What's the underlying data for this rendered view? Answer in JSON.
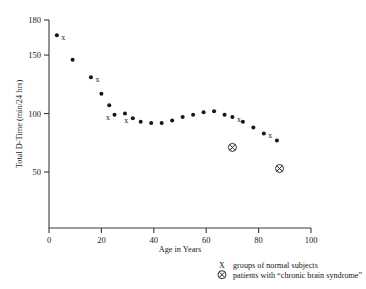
{
  "chart_data": {
    "type": "scatter",
    "title": "",
    "xlabel": "Age in Years",
    "ylabel": "Total D-Time (min/24 hrs)",
    "xlim": [
      0,
      100
    ],
    "ylim": [
      0,
      180
    ],
    "xticks": [
      0,
      20,
      40,
      60,
      80,
      100
    ],
    "yticks": [
      50,
      100,
      150,
      180
    ],
    "grid": false,
    "legend_position": "below-right",
    "series": [
      {
        "name": "groups of normal subjects",
        "marker": "dot-with-x",
        "points": [
          {
            "x": 3,
            "y": 167,
            "marked": true
          },
          {
            "x": 9,
            "y": 146,
            "marked": false
          },
          {
            "x": 16,
            "y": 131,
            "marked": true
          },
          {
            "x": 20,
            "y": 117,
            "marked": false
          },
          {
            "x": 23,
            "y": 107,
            "marked": false
          },
          {
            "x": 25,
            "y": 99,
            "marked": true
          },
          {
            "x": 29,
            "y": 100,
            "marked": false
          },
          {
            "x": 32,
            "y": 96,
            "marked": true
          },
          {
            "x": 35,
            "y": 93,
            "marked": false
          },
          {
            "x": 39,
            "y": 92,
            "marked": false
          },
          {
            "x": 43,
            "y": 92,
            "marked": false
          },
          {
            "x": 47,
            "y": 94,
            "marked": false
          },
          {
            "x": 51,
            "y": 97,
            "marked": false
          },
          {
            "x": 55,
            "y": 99,
            "marked": false
          },
          {
            "x": 59,
            "y": 101,
            "marked": false
          },
          {
            "x": 63,
            "y": 102,
            "marked": false
          },
          {
            "x": 67,
            "y": 99,
            "marked": false
          },
          {
            "x": 70,
            "y": 97,
            "marked": true
          },
          {
            "x": 74,
            "y": 93,
            "marked": false
          },
          {
            "x": 78,
            "y": 88,
            "marked": false
          },
          {
            "x": 82,
            "y": 83,
            "marked": true
          },
          {
            "x": 87,
            "y": 77,
            "marked": false
          }
        ]
      },
      {
        "name": "patients with “chronic brain syndrome”",
        "marker": "circled-x",
        "points": [
          {
            "x": 70,
            "y": 71
          },
          {
            "x": 88,
            "y": 53
          }
        ]
      }
    ]
  },
  "legend": {
    "entries": [
      {
        "symbol": "X",
        "label": "groups of normal subjects"
      },
      {
        "symbol": "⊗",
        "label": "patients with “chronic brain syndrome”"
      }
    ]
  },
  "colors": {
    "marker": "#161616",
    "axis": "#3a3a3a",
    "background": "#ffffff"
  }
}
